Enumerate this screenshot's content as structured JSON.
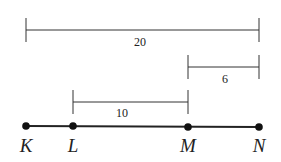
{
  "diagram": {
    "points": [
      {
        "label": "K",
        "x": 26
      },
      {
        "label": "L",
        "x": 73
      },
      {
        "label": "M",
        "x": 188
      },
      {
        "label": "N",
        "x": 259
      }
    ],
    "line_y": 126,
    "measurements": [
      {
        "from": "K",
        "to": "N",
        "value": "20"
      },
      {
        "from": "M",
        "to": "N",
        "value": "6"
      },
      {
        "from": "L",
        "to": "M",
        "value": "10"
      }
    ]
  }
}
